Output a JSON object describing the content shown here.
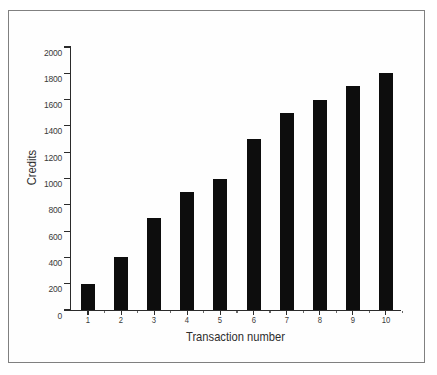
{
  "figure": {
    "background_color": "#ffffff",
    "frame_color": "#808080",
    "bar_color": "#0d0d0d",
    "axis_color": "#2b2b2b"
  },
  "chart_data": {
    "type": "bar",
    "title": "",
    "xlabel": "Transaction number",
    "ylabel": "Credits",
    "categories": [
      "1",
      "2",
      "3",
      "4",
      "5",
      "6",
      "7",
      "8",
      "9",
      "10"
    ],
    "values": [
      200,
      400,
      700,
      900,
      1000,
      1300,
      1500,
      1600,
      1700,
      1800
    ],
    "ylim": [
      0,
      2000
    ],
    "yticks": [
      0,
      200,
      400,
      600,
      800,
      1000,
      1200,
      1400,
      1600,
      1800,
      2000
    ],
    "ytick_labels": [
      "0",
      "200",
      "400",
      "600",
      "800",
      "1000",
      "1200",
      "1400",
      "1600",
      "1800",
      "2000"
    ],
    "xtick_labels": [
      "1",
      "2",
      "3",
      "4",
      "5",
      "6",
      "7",
      "8",
      "9",
      "10"
    ],
    "grid": false,
    "legend": null,
    "legend_position": "none",
    "series": [
      {
        "name": "Credits",
        "values": [
          200,
          400,
          700,
          900,
          1000,
          1300,
          1500,
          1600,
          1700,
          1800
        ]
      }
    ]
  }
}
